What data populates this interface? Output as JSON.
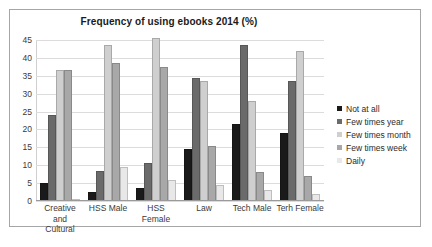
{
  "chart_data": {
    "type": "bar",
    "title": "Frequency of using ebooks 2014 (%)",
    "xlabel": "",
    "ylabel": "",
    "ylim": [
      0,
      45
    ],
    "yticks": [
      0,
      5,
      10,
      15,
      20,
      25,
      30,
      35,
      40,
      45
    ],
    "grid": true,
    "legend_position": "right",
    "categories": [
      "Creative and Cultural",
      "HSS Male",
      "HSS Female",
      "Law",
      "Tech Male",
      "Terh Female"
    ],
    "category_lines": [
      [
        "Creative and",
        "Cultural"
      ],
      [
        "HSS Male"
      ],
      [
        "HSS Female"
      ],
      [
        "Law"
      ],
      [
        "Tech Male"
      ],
      [
        "Terh Female"
      ]
    ],
    "series": [
      {
        "name": "Not at all",
        "color": "#1a1a1a",
        "values": [
          5,
          2.5,
          3.5,
          14.5,
          21.5,
          19
        ]
      },
      {
        "name": "Few times year",
        "color": "#6b6b6b",
        "values": [
          24,
          8.5,
          10.5,
          34.5,
          43.5,
          33.5
        ]
      },
      {
        "name": "Few times month",
        "color": "#cfcfcf",
        "values": [
          36.5,
          43.5,
          45.5,
          33.5,
          28,
          42
        ]
      },
      {
        "name": "Few times week",
        "color": "#a8a8a8",
        "values": [
          36.5,
          38.5,
          37.5,
          15.5,
          8,
          7
        ]
      },
      {
        "name": "Daily",
        "color": "#e8e8e8",
        "values": [
          0.5,
          9.5,
          6,
          4.5,
          3,
          2
        ]
      }
    ]
  }
}
